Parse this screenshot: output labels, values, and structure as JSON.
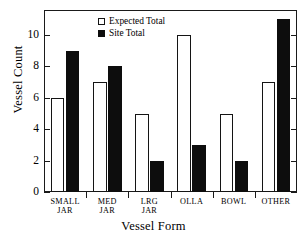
{
  "chart_data": {
    "type": "bar",
    "title": "",
    "subtitle": "",
    "xlabel": "Vessel Form",
    "ylabel": "Vessel Count",
    "categories": [
      "SMALL\nJAR",
      "MED\nJAR",
      "LRG\nJAR",
      "OLLA",
      "BOWL",
      "OTHER"
    ],
    "series": [
      {
        "name": "Expected Total",
        "values": [
          6,
          7,
          5,
          10,
          5,
          7
        ],
        "color": "#ffffff",
        "edgecolor": "#141414"
      },
      {
        "name": "Site Total",
        "values": [
          9,
          8,
          2,
          3,
          2,
          11
        ],
        "color": "#0d0d0d",
        "edgecolor": "#0d0d0d"
      }
    ],
    "ylim": [
      0,
      11.6
    ],
    "yticks": [
      0,
      2,
      4,
      6,
      8,
      10
    ],
    "ytick_labels": [
      "0",
      "2",
      "4",
      "6",
      "8",
      "10"
    ],
    "grid": false,
    "legend_position": "upper center",
    "frame": true,
    "right_ticks": true
  },
  "legend": {
    "entries": [
      {
        "label": "Expected Total",
        "swatch": "open-square"
      },
      {
        "label": "Site Total",
        "swatch": "filled-square"
      }
    ]
  },
  "axes": {
    "y_title": "Vessel Count",
    "x_title": "Vessel Form"
  }
}
